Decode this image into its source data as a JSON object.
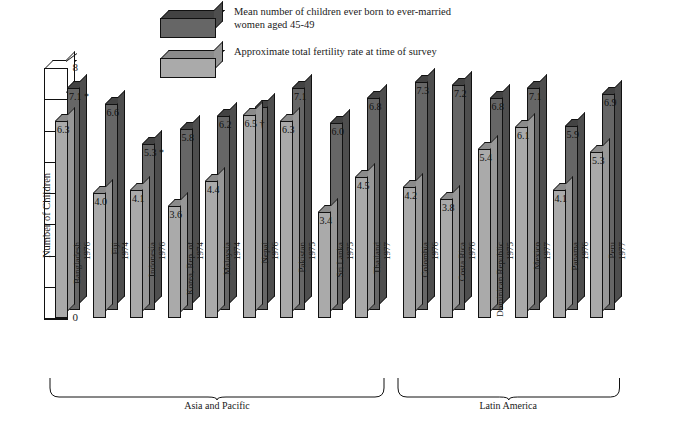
{
  "chart_data": {
    "type": "bar",
    "title": "",
    "xlabel": "",
    "ylabel": "Number of Children",
    "ylim": [
      0,
      8
    ],
    "yticks": [
      0,
      1,
      2,
      3,
      4,
      5,
      6,
      7,
      8
    ],
    "grid": false,
    "legend_position": "top-center",
    "orientation": "grouped-3d",
    "series": [
      {
        "name": "Mean number of children ever born to ever-married women aged 45-49",
        "color": "#666666",
        "values": [
          7.1,
          6.6,
          5.3,
          5.8,
          6.2,
          6.5,
          7.1,
          6.0,
          6.8,
          7.3,
          7.2,
          6.8,
          7.1,
          5.9,
          6.9
        ]
      },
      {
        "name": "Approximate total fertility rate at time of survey",
        "color": "#aaaaaa",
        "values": [
          6.3,
          4.0,
          4.1,
          3.6,
          4.4,
          6.5,
          6.3,
          3.4,
          4.5,
          4.2,
          3.8,
          5.4,
          6.1,
          4.1,
          5.3
        ]
      }
    ],
    "categories": [
      "Bangladesh",
      "Fiji",
      "Indonesia",
      "Korea, Rep. of",
      "Malaysia",
      "Nepal",
      "Pakistan",
      "Sri Lanka",
      "Thailand",
      "Colombia",
      "Costa Rica",
      "Dominican Republic",
      "Mexico",
      "Panama",
      "Peru"
    ],
    "category_years": [
      "1976",
      "1974",
      "1976",
      "1974",
      "1974",
      "1976",
      "1975",
      "1975",
      "1977",
      "1976",
      "1976",
      "1975",
      "1977",
      "1976",
      "1977"
    ],
    "value_labels_back": [
      "7.1 *",
      "6.6",
      "5.3 *",
      "5.8",
      "6.2",
      "",
      "7.1",
      "6.0",
      "6.8",
      "7.3",
      "7.2",
      "6.8",
      "7.1",
      "5.9",
      "6.9"
    ],
    "value_labels_front": [
      "6.3",
      "4.0",
      "4.1",
      "3.6",
      "4.4",
      "6.5 †",
      "6.3",
      "3.4",
      "4.5",
      "4.2",
      "3.8",
      "5.4",
      "6.1",
      "4.1",
      "5.3"
    ],
    "groups": [
      {
        "label": "Asia and Pacific",
        "start": 0,
        "end": 8
      },
      {
        "label": "Latin America",
        "start": 9,
        "end": 14
      }
    ]
  },
  "legend": {
    "items": [
      {
        "label": "Mean number of children ever born to ever-married women aged 45-49",
        "swatch": "dark-gray-3d-box"
      },
      {
        "label": "Approximate total fertility rate at time of survey",
        "swatch": "light-gray-3d-box"
      }
    ]
  },
  "axis": {
    "y_title": "Number of Children",
    "y_ticks": [
      "8",
      "7",
      "6",
      "5",
      "4",
      "3",
      "2",
      "1",
      "0"
    ]
  },
  "colors": {
    "series_back": "#666666",
    "series_back_top": "#434343",
    "series_front": "#aaaaaa",
    "series_front_top": "#8b8b8b",
    "outline": "#111111",
    "background": "#ffffff"
  }
}
